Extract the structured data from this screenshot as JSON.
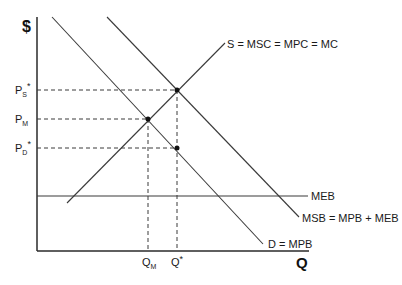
{
  "diagram": {
    "type": "economics-supply-demand-positive-externality",
    "axes": {
      "y_label": "$",
      "x_label": "Q"
    },
    "curves": {
      "supply": "S = MSC = MPC = MC",
      "demand": "D = MPB",
      "msb": "MSB = MPB + MEB",
      "meb": "MEB"
    },
    "price_labels": {
      "ps": {
        "main": "P",
        "sub": "S",
        "sup": "*"
      },
      "pm": {
        "main": "P",
        "sub": "M"
      },
      "pd": {
        "main": "P",
        "sub": "D",
        "sup": "*"
      }
    },
    "quantity_labels": {
      "qm": {
        "main": "Q",
        "sub": "M"
      },
      "qstar": {
        "main": "Q",
        "sup": "*"
      }
    },
    "colors": {
      "line": "#3a3a3a",
      "text": "#1a1a1a",
      "background": "#ffffff"
    }
  }
}
